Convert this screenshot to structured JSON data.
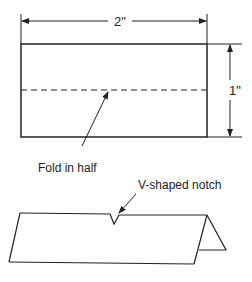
{
  "diagram": {
    "width_dimension": "2\"",
    "height_dimension": "1\"",
    "fold_label": "Fold in half",
    "notch_label": "V-shaped notch"
  },
  "colors": {
    "line": "#222222",
    "background": "#ffffff"
  }
}
